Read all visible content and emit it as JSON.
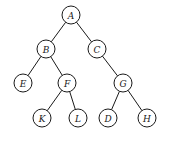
{
  "diagram": {
    "type": "binary-tree",
    "nodes": [
      {
        "id": "A",
        "label": "A",
        "x": 71,
        "y": 15
      },
      {
        "id": "B",
        "label": "B",
        "x": 46,
        "y": 49
      },
      {
        "id": "C",
        "label": "C",
        "x": 97,
        "y": 49
      },
      {
        "id": "E",
        "label": "E",
        "x": 23,
        "y": 83
      },
      {
        "id": "F",
        "label": "F",
        "x": 67,
        "y": 83
      },
      {
        "id": "G",
        "label": "G",
        "x": 123,
        "y": 83
      },
      {
        "id": "K",
        "label": "K",
        "x": 42,
        "y": 118
      },
      {
        "id": "L",
        "label": "L",
        "x": 78,
        "y": 118
      },
      {
        "id": "D",
        "label": "D",
        "x": 108,
        "y": 118
      },
      {
        "id": "H",
        "label": "H",
        "x": 147,
        "y": 118
      }
    ],
    "edges": [
      [
        "A",
        "B"
      ],
      [
        "A",
        "C"
      ],
      [
        "B",
        "E"
      ],
      [
        "B",
        "F"
      ],
      [
        "C",
        "G"
      ],
      [
        "F",
        "K"
      ],
      [
        "F",
        "L"
      ],
      [
        "G",
        "D"
      ],
      [
        "G",
        "H"
      ]
    ],
    "node_radius": 9
  }
}
